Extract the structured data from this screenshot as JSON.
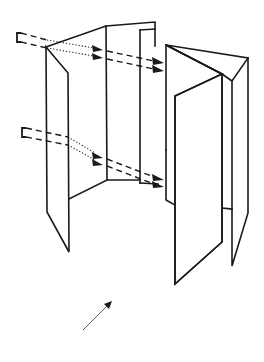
{
  "figure": {
    "stroke_color": "#1a1a1a",
    "background": "#ffffff",
    "labels": []
  },
  "panels": [
    {
      "name": "panel-left-flap"
    },
    {
      "name": "panel-left-inner"
    },
    {
      "name": "panel-center-back"
    },
    {
      "name": "panel-front"
    },
    {
      "name": "panel-right-flap"
    }
  ],
  "arrows": {
    "upper_pair": {
      "style": "dashed-dotted-dashed",
      "count": 2
    },
    "lower_pair": {
      "style": "dashed-dotted-dashed",
      "count": 2
    },
    "viewing_direction": {
      "style": "solid",
      "direction": "up-right"
    }
  }
}
